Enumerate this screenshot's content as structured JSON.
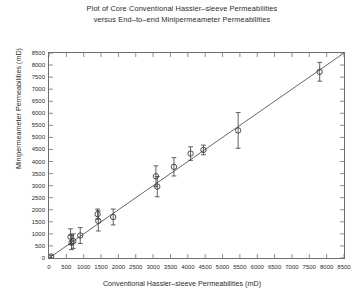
{
  "chart_data": {
    "type": "scatter",
    "title": "Plot of Core Conventional Hassler–sleeve Permeabilities\nversus End–to–end Minipermeameter Permeabilities",
    "title_line1": "Plot of Core Conventional Hassler–sleeve Permeabilities",
    "title_line2": "versus End–to–end Minipermeameter Permeabilities",
    "xlabel": "Conventional Hassler–sleeve Permeabilities (mD)",
    "ylabel": "Minipermeameter Permeabilities (mD)",
    "xlim": [
      0,
      8500
    ],
    "ylim": [
      0,
      8500
    ],
    "xticks": [
      0,
      500,
      1000,
      1500,
      2000,
      2500,
      3000,
      3500,
      4000,
      4500,
      5000,
      5500,
      6000,
      6500,
      7000,
      7500,
      8000,
      8500
    ],
    "yticks": [
      0,
      500,
      1000,
      1500,
      2000,
      2500,
      3000,
      3500,
      4000,
      4500,
      5000,
      5500,
      6000,
      6500,
      7000,
      7500,
      8000,
      8500
    ],
    "xticklabels": [
      "0",
      "500",
      "1000",
      "1500",
      "2000",
      "2500",
      "3000",
      "3500",
      "4000",
      "4500",
      "5000",
      "5500",
      "6000",
      "6500",
      "7000",
      "7500",
      "8000",
      "8500"
    ],
    "yticklabels": [
      "0",
      "500",
      "1000",
      "1500",
      "2000",
      "2500",
      "3000",
      "3500",
      "4000",
      "4500",
      "5000",
      "5500",
      "6000",
      "6500",
      "7000",
      "7500",
      "8000",
      "8500"
    ],
    "grid": false,
    "legend": false,
    "marker": "open-circle",
    "error_bars": "vertical",
    "reference_line": {
      "name": "1:1 line",
      "from": [
        0,
        0
      ],
      "to": [
        8500,
        8500
      ],
      "color": "#555555"
    },
    "series": [
      {
        "name": "Core samples",
        "color": "#3a3a3a",
        "points": [
          {
            "x": 60,
            "y": 60,
            "yerr": 60
          },
          {
            "x": 620,
            "y": 880,
            "yerr": 330
          },
          {
            "x": 650,
            "y": 640,
            "yerr": 290
          },
          {
            "x": 700,
            "y": 700,
            "yerr": 300
          },
          {
            "x": 900,
            "y": 930,
            "yerr": 330
          },
          {
            "x": 1400,
            "y": 1820,
            "yerr": 210
          },
          {
            "x": 1420,
            "y": 1540,
            "yerr": 420
          },
          {
            "x": 1850,
            "y": 1700,
            "yerr": 330
          },
          {
            "x": 3080,
            "y": 3390,
            "yerr": 430
          },
          {
            "x": 3120,
            "y": 2960,
            "yerr": 420
          },
          {
            "x": 3600,
            "y": 3780,
            "yerr": 380
          },
          {
            "x": 4080,
            "y": 4330,
            "yerr": 280
          },
          {
            "x": 4450,
            "y": 4480,
            "yerr": 200
          },
          {
            "x": 5450,
            "y": 5290,
            "yerr": 740
          },
          {
            "x": 7800,
            "y": 7720,
            "yerr": 390
          }
        ]
      }
    ]
  }
}
